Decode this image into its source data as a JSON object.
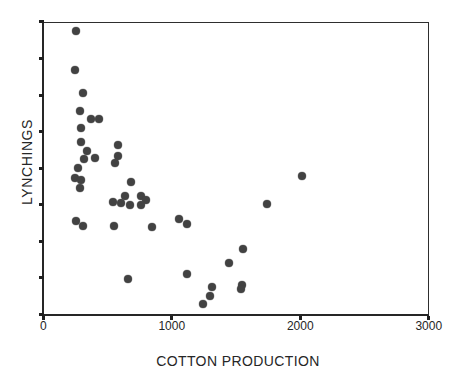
{
  "colors": {
    "background": "#ffffff",
    "frame": "#2e2e2e",
    "marker": "#424242",
    "text": "#262626"
  },
  "chart_data": {
    "type": "scatter",
    "title": "",
    "xlabel": "COTTON PRODUCTION",
    "ylabel": "LYNCHINGS",
    "xlim": [
      0,
      3000
    ],
    "ylim": [
      0,
      8
    ],
    "x_ticks": [
      0,
      1000,
      2000,
      3000
    ],
    "x_tick_labels": [
      "0",
      "1000",
      "2000",
      "3000"
    ],
    "y_ticks": {
      "count": 9,
      "labels_visible": false
    },
    "grid": false,
    "legend": false,
    "frame": "full-box",
    "marker": {
      "shape": "circle",
      "diameter_px": 8,
      "color": "#424242"
    },
    "points": [
      [
        252,
        7.75
      ],
      [
        247,
        6.68
      ],
      [
        307,
        6.06
      ],
      [
        286,
        5.57
      ],
      [
        371,
        5.34
      ],
      [
        434,
        5.34
      ],
      [
        291,
        5.1
      ],
      [
        293,
        4.72
      ],
      [
        579,
        4.63
      ],
      [
        340,
        4.47
      ],
      [
        584,
        4.33
      ],
      [
        405,
        4.27
      ],
      [
        314,
        4.25
      ],
      [
        558,
        4.15
      ],
      [
        270,
        4.01
      ],
      [
        2014,
        3.78
      ],
      [
        244,
        3.72
      ],
      [
        293,
        3.67
      ],
      [
        683,
        3.63
      ],
      [
        283,
        3.45
      ],
      [
        760,
        3.24
      ],
      [
        636,
        3.24
      ],
      [
        802,
        3.14
      ],
      [
        758,
        3.0
      ],
      [
        545,
        3.08
      ],
      [
        605,
        3.04
      ],
      [
        675,
        2.99
      ],
      [
        1741,
        3.02
      ],
      [
        255,
        2.56
      ],
      [
        307,
        2.41
      ],
      [
        550,
        2.42
      ],
      [
        849,
        2.4
      ],
      [
        1059,
        2.6
      ],
      [
        1115,
        2.48
      ],
      [
        1557,
        1.78
      ],
      [
        1448,
        1.4
      ],
      [
        657,
        0.96
      ],
      [
        1116,
        1.09
      ],
      [
        1311,
        0.76
      ],
      [
        1549,
        0.79
      ],
      [
        1539,
        0.68
      ],
      [
        1298,
        0.5
      ],
      [
        1241,
        0.27
      ]
    ]
  }
}
